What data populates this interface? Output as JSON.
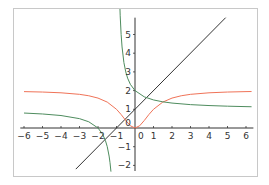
{
  "chart_data": {
    "type": "line",
    "title": "",
    "xlabel": "",
    "ylabel": "",
    "xlim": [
      -6.2,
      6.4
    ],
    "ylim": [
      -2.3,
      5.9
    ],
    "grid": false,
    "legend": null,
    "x_ticks": [
      -6,
      -5,
      -4,
      -3,
      -2,
      -1,
      0,
      1,
      2,
      3,
      4,
      5,
      6
    ],
    "x_tick_labels": [
      "−6",
      "−5",
      "−4",
      "−3",
      "−2",
      "−1",
      "0",
      "1",
      "2",
      "3",
      "4",
      "5",
      "6"
    ],
    "y_ticks": [
      -2,
      -1,
      0,
      1,
      2,
      3,
      4,
      5
    ],
    "y_tick_labels": [
      "−2",
      "−1",
      "0",
      "1",
      "2",
      "3",
      "4",
      "5"
    ],
    "series": [
      {
        "name": "y = x + 1",
        "color": "#333333",
        "points": [
          [
            -3.2,
            -2.2
          ],
          [
            4.9,
            5.9
          ]
        ]
      },
      {
        "name": "y = 2x^2/(1+x^2)",
        "color": "#f07358",
        "points": [
          [
            -6,
            1.946
          ],
          [
            -5,
            1.923
          ],
          [
            -4,
            1.882
          ],
          [
            -3,
            1.8
          ],
          [
            -2.5,
            1.724
          ],
          [
            -2,
            1.6
          ],
          [
            -1.5,
            1.385
          ],
          [
            -1,
            1.0
          ],
          [
            -0.75,
            0.72
          ],
          [
            -0.5,
            0.4
          ],
          [
            -0.25,
            0.118
          ],
          [
            0,
            0
          ],
          [
            0.25,
            0.118
          ],
          [
            0.5,
            0.4
          ],
          [
            0.75,
            0.72
          ],
          [
            1,
            1.0
          ],
          [
            1.5,
            1.385
          ],
          [
            2,
            1.6
          ],
          [
            2.5,
            1.724
          ],
          [
            3,
            1.8
          ],
          [
            4,
            1.882
          ],
          [
            5,
            1.923
          ],
          [
            6,
            1.946
          ],
          [
            6.3,
            1.951
          ]
        ]
      },
      {
        "name": "y = (x+2)/(x+1), left branch",
        "color": "#4e8c5e",
        "points": [
          [
            -6,
            0.8
          ],
          [
            -5,
            0.75
          ],
          [
            -4,
            0.667
          ],
          [
            -3,
            0.5
          ],
          [
            -2.5,
            0.333
          ],
          [
            -2,
            0
          ],
          [
            -1.75,
            -0.333
          ],
          [
            -1.6,
            -0.667
          ],
          [
            -1.5,
            -1.0
          ],
          [
            -1.4,
            -1.5
          ],
          [
            -1.35,
            -1.857
          ],
          [
            -1.3,
            -2.333
          ]
        ]
      },
      {
        "name": "y = (x+2)/(x+1), right branch",
        "color": "#4e8c5e",
        "points": [
          [
            -0.83,
            6.88
          ],
          [
            -0.8,
            6.0
          ],
          [
            -0.75,
            5.0
          ],
          [
            -0.7,
            4.333
          ],
          [
            -0.6,
            3.5
          ],
          [
            -0.5,
            3.0
          ],
          [
            -0.4,
            2.667
          ],
          [
            -0.25,
            2.333
          ],
          [
            0,
            2.0
          ],
          [
            0.5,
            1.667
          ],
          [
            1,
            1.5
          ],
          [
            1.5,
            1.4
          ],
          [
            2,
            1.333
          ],
          [
            3,
            1.25
          ],
          [
            4,
            1.2
          ],
          [
            5,
            1.167
          ],
          [
            6,
            1.143
          ],
          [
            6.3,
            1.137
          ]
        ]
      }
    ]
  }
}
